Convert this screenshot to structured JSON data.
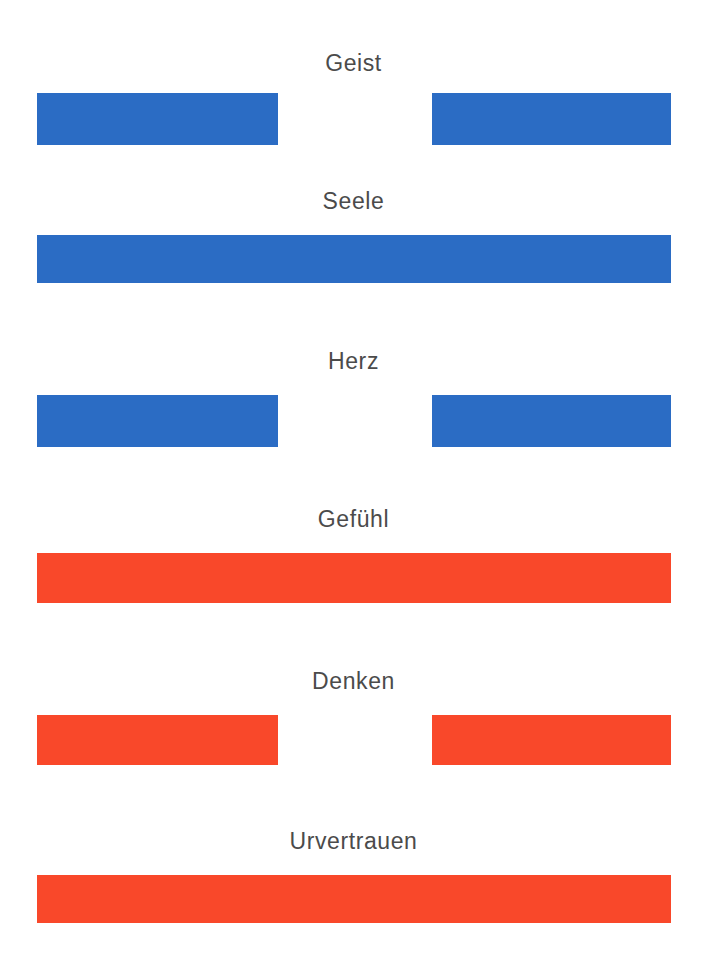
{
  "page": {
    "background_color": "#ffffff",
    "width": 707,
    "height": 973,
    "label_color": "#4b4b4b"
  },
  "palette": {
    "blue": "#2b6cc4",
    "red": "#f9482a"
  },
  "chart_data": {
    "type": "bar",
    "title": "",
    "subtitle": "",
    "xlabel": "",
    "ylabel": "",
    "orientation": "horizontal",
    "grid": false,
    "legend": "none",
    "categories": [
      "Geist",
      "Seele",
      "Herz",
      "Gefühl",
      "Denken",
      "Urvertrauen"
    ],
    "series": [
      {
        "name": "Segment-Breite",
        "values": [
          0.68,
          1.0,
          0.68,
          1.0,
          0.68,
          1.0
        ]
      }
    ],
    "annotations": [
      "Blaue Balken: Geist, Seele, Herz",
      "Rote Balken: Gefühl, Denken, Urvertrauen",
      "Unterbrochene Balken: Geist, Herz, Denken",
      "Durchgehende Balken: Seele, Gefühl, Urvertrauen"
    ]
  },
  "rows": [
    {
      "id": "geist",
      "label": "Geist",
      "color": "#2b6cc4",
      "color_name": "blue",
      "style": "split",
      "segments": [
        {
          "left": 37,
          "width": 241
        },
        {
          "left": 432,
          "width": 239
        }
      ]
    },
    {
      "id": "seele",
      "label": "Seele",
      "color": "#2b6cc4",
      "color_name": "blue",
      "style": "full",
      "segments": [
        {
          "left": 37,
          "width": 634
        }
      ]
    },
    {
      "id": "herz",
      "label": "Herz",
      "color": "#2b6cc4",
      "color_name": "blue",
      "style": "split",
      "segments": [
        {
          "left": 37,
          "width": 241
        },
        {
          "left": 432,
          "width": 239
        }
      ]
    },
    {
      "id": "gefuehl",
      "label": "Gefühl",
      "color": "#f9482a",
      "color_name": "red",
      "style": "full",
      "segments": [
        {
          "left": 37,
          "width": 634
        }
      ]
    },
    {
      "id": "denken",
      "label": "Denken",
      "color": "#f9482a",
      "color_name": "red",
      "style": "split",
      "segments": [
        {
          "left": 37,
          "width": 241
        },
        {
          "left": 432,
          "width": 239
        }
      ]
    },
    {
      "id": "urvertrauen",
      "label": "Urvertrauen",
      "color": "#f9482a",
      "color_name": "red",
      "style": "full",
      "segments": [
        {
          "left": 37,
          "width": 634
        }
      ]
    }
  ]
}
